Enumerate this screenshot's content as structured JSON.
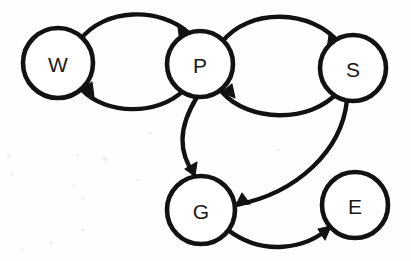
{
  "diagram": {
    "type": "directed-graph",
    "background_color": "#fefefe",
    "stroke_color": "#121212",
    "node_fill": "#ffffff",
    "nodes": [
      {
        "id": "W",
        "label": "W",
        "cx": 58,
        "cy": 63,
        "r": 35
      },
      {
        "id": "P",
        "label": "P",
        "cx": 200,
        "cy": 64,
        "r": 33
      },
      {
        "id": "S",
        "label": "S",
        "cx": 353,
        "cy": 68,
        "r": 33
      },
      {
        "id": "G",
        "label": "G",
        "cx": 201,
        "cy": 210,
        "r": 34
      },
      {
        "id": "E",
        "label": "E",
        "cx": 355,
        "cy": 205,
        "r": 33
      }
    ],
    "edges": [
      {
        "id": "w-to-p",
        "from": "W",
        "to": "P",
        "label": "",
        "curve": "arc-above"
      },
      {
        "id": "p-to-w",
        "from": "P",
        "to": "W",
        "label": "",
        "curve": "arc-below"
      },
      {
        "id": "p-to-s",
        "from": "P",
        "to": "S",
        "label": "",
        "curve": "arc-above"
      },
      {
        "id": "s-to-p",
        "from": "S",
        "to": "P",
        "label": "",
        "curve": "arc-below"
      },
      {
        "id": "p-to-g",
        "from": "P",
        "to": "G",
        "label": "",
        "curve": "arc-left"
      },
      {
        "id": "s-to-g",
        "from": "S",
        "to": "G",
        "label": "",
        "curve": "sweep-right"
      },
      {
        "id": "g-to-e",
        "from": "G",
        "to": "E",
        "label": "",
        "curve": "arc-below"
      }
    ]
  }
}
